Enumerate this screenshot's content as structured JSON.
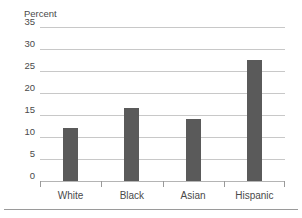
{
  "chart_data": {
    "type": "bar",
    "title": "",
    "xlabel": "",
    "ylabel": "Percent",
    "categories": [
      "White",
      "Black",
      "Asian",
      "Hispanic"
    ],
    "values": [
      12,
      16.5,
      14,
      27.5
    ],
    "ylim": [
      0,
      35
    ],
    "ytick_labels": [
      "0",
      "5",
      "10",
      "15",
      "20",
      "25",
      "30",
      "35"
    ],
    "ytick_values": [
      0,
      5,
      10,
      15,
      20,
      25,
      30,
      35
    ],
    "grid": "horizontal",
    "legend": "none",
    "bar_color": "#5a5a5a",
    "gridline_color": "#c8c8c8",
    "axis_color": "#9a9a9a",
    "text_color": "#4a4a4a"
  }
}
